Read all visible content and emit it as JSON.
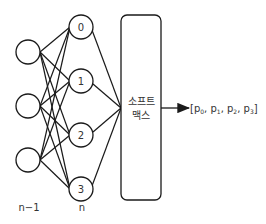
{
  "diagram": {
    "type": "neural-network-softmax",
    "layers": [
      {
        "label": "n−1",
        "nodes": [
          {
            "label": "",
            "cx": 28,
            "cy": 52
          },
          {
            "label": "",
            "cx": 28,
            "cy": 106
          },
          {
            "label": "",
            "cx": 28,
            "cy": 160
          }
        ]
      },
      {
        "label": "n",
        "nodes": [
          {
            "label": "0",
            "cx": 81,
            "cy": 27
          },
          {
            "label": "1",
            "cx": 81,
            "cy": 81
          },
          {
            "label": "2",
            "cx": 81,
            "cy": 135
          },
          {
            "label": "3",
            "cx": 81,
            "cy": 189
          }
        ]
      }
    ],
    "softmax_box": {
      "label_line1": "소프트",
      "label_line2": "맥스"
    },
    "output": {
      "prefix": "[",
      "items": [
        {
          "base": "p",
          "sub": "0"
        },
        {
          "base": "p",
          "sub": "1"
        },
        {
          "base": "p",
          "sub": "2"
        },
        {
          "base": "p",
          "sub": "3"
        }
      ],
      "suffix": "]"
    },
    "colors": {
      "stroke": "#1a1a1a",
      "text": "#333333",
      "background": "#ffffff"
    }
  }
}
